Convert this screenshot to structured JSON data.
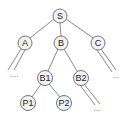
{
  "diagram": {
    "type": "tree",
    "nodes": [
      {
        "id": "S",
        "label": "S",
        "x": 60,
        "y": 16
      },
      {
        "id": "A",
        "label": "A",
        "x": 25,
        "y": 43
      },
      {
        "id": "B",
        "label": "B",
        "x": 61,
        "y": 43
      },
      {
        "id": "C",
        "label": "C",
        "x": 98,
        "y": 43
      },
      {
        "id": "B1",
        "label": "B1",
        "x": 45,
        "y": 78
      },
      {
        "id": "B2",
        "label": "B2",
        "x": 81,
        "y": 78
      },
      {
        "id": "P1",
        "label": "P1",
        "x": 28,
        "y": 103
      },
      {
        "id": "P2",
        "label": "P2",
        "x": 64,
        "y": 103
      }
    ],
    "edges": [
      {
        "from": "S",
        "to": "A"
      },
      {
        "from": "S",
        "to": "B"
      },
      {
        "from": "S",
        "to": "C"
      },
      {
        "from": "B",
        "to": "B1"
      },
      {
        "from": "B",
        "to": "B2"
      },
      {
        "from": "B1",
        "to": "P1"
      },
      {
        "from": "B1",
        "to": "P2"
      }
    ],
    "continuations": [
      {
        "from": "A",
        "label": "....",
        "label_x": 14,
        "label_y": 77
      },
      {
        "from": "C",
        "label": "...",
        "label_x": 116,
        "label_y": 78
      },
      {
        "from": "B2",
        "label": "...",
        "label_x": 97,
        "label_y": 111
      }
    ]
  }
}
